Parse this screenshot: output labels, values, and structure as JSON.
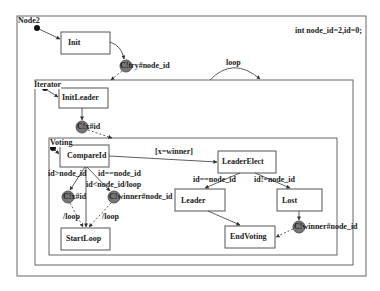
{
  "diagram": {
    "declaration": "int node_id=2,id=0;",
    "containers": [
      {
        "id": "node2",
        "label": "Node2"
      },
      {
        "id": "iterator",
        "label": "Iterator"
      },
      {
        "id": "voting",
        "label": "Voting"
      }
    ],
    "states": {
      "init": "Init",
      "init_leader": "InitLeader",
      "compare_id": "CompareId",
      "leader_elect": "LeaderElect",
      "leader": "Leader",
      "lost": "Lost",
      "start_loop": "StartLoop",
      "end_voting": "EndVoting"
    },
    "channels": {
      "c_try": "C!try#node_id",
      "c_x_1": "C!x#id",
      "c_x_2": "C!x#id",
      "c_winner_1": "C!winner#node_id",
      "c_winner_2": "C!winner#node_id"
    },
    "transitions": {
      "loop": "loop",
      "x_winner": "[x=winner]",
      "id_gt_node": "id>node_id",
      "id_eq_node": "id==node_id",
      "id_lt_node_loop": "id<node_id/loop",
      "slash_loop_1": "/loop",
      "slash_loop_2": "/loop",
      "id_eq_node_2": "id==node_id",
      "id_ne_node": "id!=node_id"
    },
    "colors": {
      "line": "#444444",
      "channel_fill": "#777777",
      "container_border": "#555555"
    }
  }
}
